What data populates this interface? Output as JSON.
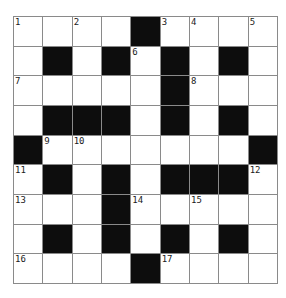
{
  "puzzle": {
    "title": "crossword-grid",
    "rows": 9,
    "cols": 9,
    "black_symbol": "#",
    "grid": [
      [
        "1",
        "",
        "2",
        "",
        "#",
        "3",
        "4",
        "",
        "5"
      ],
      [
        "",
        "#",
        "",
        "#",
        "6",
        "#",
        "",
        "#",
        ""
      ],
      [
        "7",
        "",
        "",
        "",
        "",
        "#",
        "8",
        "",
        ""
      ],
      [
        "",
        "#",
        "#",
        "#",
        "",
        "#",
        "",
        "#",
        ""
      ],
      [
        "#",
        "9",
        "10",
        "",
        "",
        "",
        "",
        "",
        "#"
      ],
      [
        "11",
        "#",
        "",
        "#",
        "",
        "#",
        "#",
        "#",
        "12"
      ],
      [
        "13",
        "",
        "",
        "#",
        "14",
        "",
        "15",
        "",
        ""
      ],
      [
        "",
        "#",
        "",
        "#",
        "",
        "#",
        "",
        "#",
        ""
      ],
      [
        "16",
        "",
        "",
        "",
        "#",
        "17",
        "",
        "",
        ""
      ]
    ],
    "clue_numbers": [
      "1",
      "2",
      "3",
      "4",
      "5",
      "6",
      "7",
      "8",
      "9",
      "10",
      "11",
      "12",
      "13",
      "14",
      "15",
      "16",
      "17"
    ],
    "colors": {
      "background": "#ffffff",
      "grid_line": "#8a8a8a",
      "black_cell": "#0d0d0d",
      "number_text": "#1a1a1a",
      "white_cell": "#ffffff"
    }
  }
}
